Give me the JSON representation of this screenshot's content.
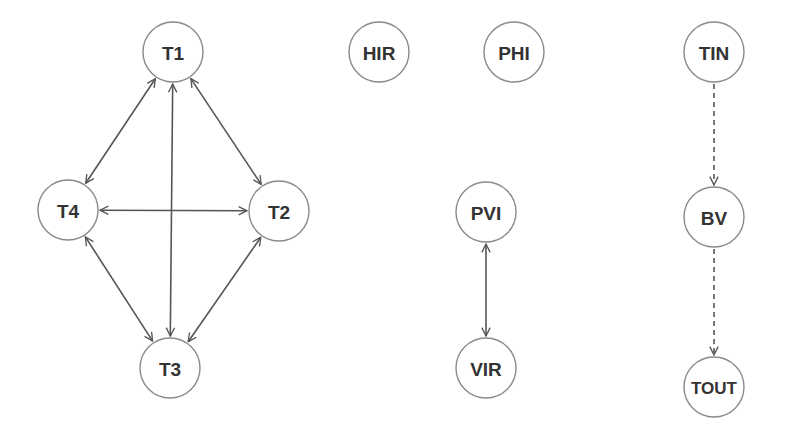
{
  "diagram": {
    "type": "node-graph",
    "colors": {
      "background": "#ffffff",
      "node_stroke": "#8a8a8a",
      "node_fill": "#ffffff",
      "edge": "#555555",
      "label": "#333333"
    },
    "nodes": {
      "T1": {
        "label": "T1",
        "cx": 173,
        "cy": 52,
        "r": 30
      },
      "T2": {
        "label": "T2",
        "cx": 279,
        "cy": 211,
        "r": 30
      },
      "T3": {
        "label": "T3",
        "cx": 170,
        "cy": 368,
        "r": 30
      },
      "T4": {
        "label": "T4",
        "cx": 68,
        "cy": 210,
        "r": 30
      },
      "HIR": {
        "label": "HIR",
        "cx": 379,
        "cy": 52,
        "r": 30
      },
      "PHI": {
        "label": "PHI",
        "cx": 514,
        "cy": 52,
        "r": 30
      },
      "PVI": {
        "label": "PVI",
        "cx": 486,
        "cy": 212,
        "r": 30
      },
      "VIR": {
        "label": "VIR",
        "cx": 486,
        "cy": 368,
        "r": 30
      },
      "TIN": {
        "label": "TIN",
        "cx": 714,
        "cy": 52,
        "r": 30
      },
      "BV": {
        "label": "BV",
        "cx": 714,
        "cy": 217,
        "r": 30
      },
      "TOUT": {
        "label": "TOUT",
        "cx": 714,
        "cy": 387,
        "r": 30
      }
    },
    "edges": [
      {
        "from": "T1",
        "to": "T4",
        "style": "solid",
        "direction": "bidirectional"
      },
      {
        "from": "T1",
        "to": "T2",
        "style": "solid",
        "direction": "bidirectional"
      },
      {
        "from": "T1",
        "to": "T3",
        "style": "solid",
        "direction": "bidirectional"
      },
      {
        "from": "T4",
        "to": "T2",
        "style": "solid",
        "direction": "bidirectional"
      },
      {
        "from": "T4",
        "to": "T3",
        "style": "solid",
        "direction": "bidirectional"
      },
      {
        "from": "T2",
        "to": "T3",
        "style": "solid",
        "direction": "bidirectional"
      },
      {
        "from": "PVI",
        "to": "VIR",
        "style": "solid",
        "direction": "bidirectional"
      },
      {
        "from": "TIN",
        "to": "BV",
        "style": "dashed",
        "direction": "forward"
      },
      {
        "from": "BV",
        "to": "TOUT",
        "style": "dashed",
        "direction": "forward"
      }
    ]
  }
}
